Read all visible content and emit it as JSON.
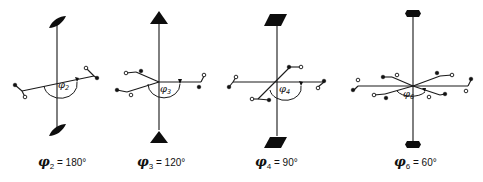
{
  "figure": {
    "panels": [
      {
        "id": "phi2",
        "symbol": "φ",
        "subscript": "2",
        "angle_text": "= 180°",
        "axis_end_shape": "lens",
        "fold": 2
      },
      {
        "id": "phi3",
        "symbol": "φ",
        "subscript": "3",
        "angle_text": "= 120°",
        "axis_end_shape": "triangle",
        "fold": 3
      },
      {
        "id": "phi4",
        "symbol": "φ",
        "subscript": "4",
        "angle_text": "= 90°",
        "axis_end_shape": "parallelogram",
        "fold": 4
      },
      {
        "id": "phi6",
        "symbol": "φ",
        "subscript": "6",
        "angle_text": "= 60°",
        "axis_end_shape": "hexagon",
        "fold": 6
      }
    ]
  }
}
